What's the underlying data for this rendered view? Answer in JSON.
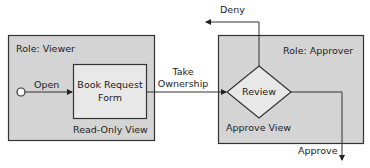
{
  "diagram": {
    "viewer_box": {
      "role_label": "Role: Viewer",
      "view_label": "Read-Only View"
    },
    "form_box": {
      "label_line1": "Book Request",
      "label_line2": "Form"
    },
    "approver_box": {
      "role_label": "Role: Approver",
      "view_label": "Approve View"
    },
    "decision": {
      "label": "Review"
    },
    "edges": {
      "open": "Open",
      "take_ownership_line1": "Take",
      "take_ownership_line2": "Ownership",
      "deny": "Deny",
      "approve": "Approve"
    },
    "colors": {
      "box_fill": "#d4d4d4",
      "form_fill": "#e8e8e8",
      "stroke": "#333333"
    }
  }
}
